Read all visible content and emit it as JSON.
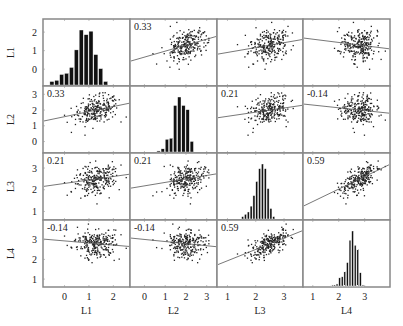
{
  "chart_data": {
    "type": "scatter-matrix",
    "title": "",
    "variables": [
      "L1",
      "L2",
      "L3",
      "L4"
    ],
    "diagonal": "histogram",
    "axis_ranges": {
      "L1": [
        -0.8,
        2.6
      ],
      "L2": [
        -0.6,
        3.4
      ],
      "L3": [
        0.7,
        3.6
      ],
      "L4": [
        0.7,
        3.9
      ]
    },
    "ticks": {
      "L1": [
        0,
        1,
        2
      ],
      "L2": [
        0,
        1,
        2,
        3
      ],
      "L3": [
        1,
        2,
        3
      ],
      "L4": [
        1,
        2,
        3
      ]
    },
    "correlations": [
      {
        "row": "L2",
        "col": "L1",
        "r": "0.33"
      },
      {
        "row": "L3",
        "col": "L1",
        "r": "0.21"
      },
      {
        "row": "L3",
        "col": "L2",
        "r": "0.21"
      },
      {
        "row": "L4",
        "col": "L1",
        "r": "-0.14"
      },
      {
        "row": "L4",
        "col": "L2",
        "r": "-0.14"
      },
      {
        "row": "L4",
        "col": "L3",
        "r": "0.59"
      }
    ],
    "upper_panel_labels": [
      {
        "row": "L1",
        "col": "L2",
        "r": "0.33"
      },
      {
        "row": "L2",
        "col": "L3",
        "r": "0.21"
      },
      {
        "row": "L2",
        "col": "L4",
        "r": "-0.14"
      },
      {
        "row": "L3",
        "col": "L4",
        "r": "0.59"
      }
    ],
    "histograms": {
      "L1": {
        "bins_start": -0.6,
        "bin_width": 0.2,
        "counts": [
          3,
          4,
          9,
          10,
          15,
          30,
          47,
          43,
          46,
          26,
          14,
          3
        ]
      },
      "L2": {
        "bins_start": 0.6,
        "bin_width": 0.2,
        "counts": [
          1,
          3,
          12,
          13,
          44,
          52,
          44,
          40,
          10
        ]
      },
      "L3": {
        "bins_start": 1.5,
        "bin_width": 0.1,
        "counts": [
          2,
          4,
          6,
          11,
          20,
          32,
          43,
          47,
          43,
          26,
          9,
          2
        ]
      },
      "L4": {
        "bins_start": 1.7,
        "bin_width": 0.1,
        "counts": [
          1,
          1,
          2,
          8,
          9,
          14,
          23,
          45,
          54,
          40,
          36,
          13,
          1
        ]
      }
    },
    "means": {
      "L1": 1.3,
      "L2": 2.0,
      "L3": 2.5,
      "L4": 2.8
    },
    "sds": {
      "L1": 0.45,
      "L2": 0.45,
      "L3": 0.35,
      "L4": 0.35
    },
    "n_points": 250,
    "grid": false,
    "legend": "none"
  },
  "axes": {
    "row_labels": [
      "L1",
      "L2",
      "L3",
      "L4"
    ],
    "col_labels": [
      "L1",
      "L2",
      "L3",
      "L4"
    ]
  }
}
